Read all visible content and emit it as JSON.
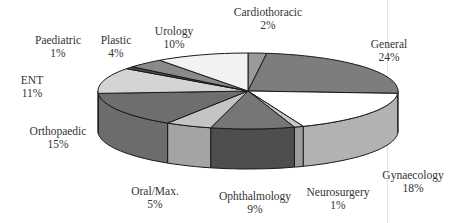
{
  "chart_data": {
    "type": "pie",
    "style": "3d-exploded-none",
    "title": "",
    "categories": [
      "Cardiothoracic",
      "General",
      "Gynaecology",
      "Neurosurgery",
      "Ophthalmology",
      "Oral/Max.",
      "Orthopaedic",
      "ENT",
      "Paediatric",
      "Plastic",
      "Urology"
    ],
    "values": [
      2,
      24,
      18,
      1,
      9,
      5,
      15,
      11,
      1,
      4,
      10
    ],
    "value_labels": [
      "2%",
      "24%",
      "18%",
      "1%",
      "9%",
      "5%",
      "15%",
      "11%",
      "1%",
      "4%",
      "10%"
    ],
    "unit": "%",
    "start_angle": "12 o'clock",
    "direction": "clockwise",
    "legend": "none (data labels beside slices)",
    "top_colors": [
      "#9a9a9a",
      "#7d7d7d",
      "#ffffff",
      "#c8c8c8",
      "#767676",
      "#c4c4c4",
      "#6e6e6e",
      "#d4d4d4",
      "#4a4a4a",
      "#8a8a8a",
      "#f2f2f2"
    ],
    "side_colors": [
      "#8a8a8a",
      "#6f6f6f",
      "#b2b2b2",
      "#9c9c9c",
      "#4e4e4e",
      "#a4a4a4",
      "#6c6c6c",
      "#b0b0b0",
      "#404040",
      "#7a7a7a",
      "#d8d8d8"
    ],
    "geometry": {
      "cx": 248,
      "cy": 91,
      "rx": 150,
      "ry": 38,
      "depth": 40
    }
  },
  "labels": [
    {
      "name": "Cardiothoracic",
      "pct": "2%",
      "x": 268,
      "y": 6
    },
    {
      "name": "General",
      "pct": "24%",
      "x": 389,
      "y": 38
    },
    {
      "name": "Gynaecology",
      "pct": "18%",
      "x": 413,
      "y": 169
    },
    {
      "name": "Neurosurgery",
      "pct": "1%",
      "x": 338,
      "y": 186
    },
    {
      "name": "Ophthalmology",
      "pct": "9%",
      "x": 255,
      "y": 190
    },
    {
      "name": "Oral/Max.",
      "pct": "5%",
      "x": 155,
      "y": 185
    },
    {
      "name": "Orthopaedic",
      "pct": "15%",
      "x": 58,
      "y": 125
    },
    {
      "name": "ENT",
      "pct": "11%",
      "x": 32,
      "y": 74
    },
    {
      "name": "Paediatric",
      "pct": "1%",
      "x": 58,
      "y": 34
    },
    {
      "name": "Plastic",
      "pct": "4%",
      "x": 116,
      "y": 34
    },
    {
      "name": "Urology",
      "pct": "10%",
      "x": 174,
      "y": 25
    }
  ]
}
